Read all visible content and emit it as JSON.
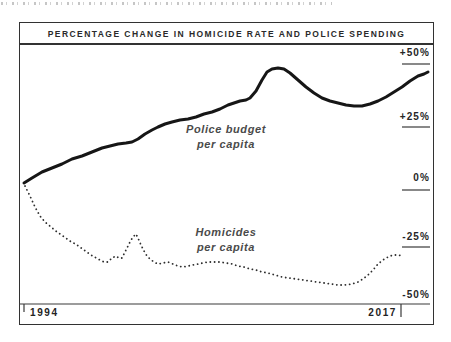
{
  "chart_data": {
    "type": "line",
    "title": "PERCENTAGE CHANGE IN HOMICIDE RATE AND POLICE SPENDING",
    "grid": false,
    "legend_position": "inline-annotations",
    "x_axis": {
      "range": [
        1994,
        2017
      ],
      "tick_labels": [
        "1994",
        "2017"
      ]
    },
    "y_axis": {
      "unit": "percent change",
      "range": [
        -55,
        55
      ],
      "tick_values": [
        50,
        25,
        0,
        -25,
        -50
      ],
      "tick_labels": [
        "+50%",
        "+25%",
        "0%",
        "-25%",
        "-50%"
      ]
    },
    "years": [
      1994,
      1995,
      1996,
      1997,
      1998,
      1999,
      2000,
      2001,
      2002,
      2003,
      2004,
      2005,
      2006,
      2007,
      2008,
      2009,
      2010,
      2011,
      2012,
      2013,
      2014,
      2015,
      2016,
      2017
    ],
    "series": [
      {
        "name": "Police budget per capita",
        "label_line1": "Police budget",
        "label_line2": "per capita",
        "line_style": "solid",
        "color": "#161616",
        "values_pct": [
          0,
          7,
          10,
          13,
          16,
          19,
          21,
          24,
          28,
          29,
          31,
          33,
          36,
          39,
          48,
          47,
          42,
          38,
          36,
          35,
          36,
          40,
          45,
          48
        ],
        "path_px": [
          [
            5,
            139
          ],
          [
            13,
            134
          ],
          [
            23,
            128
          ],
          [
            33,
            124
          ],
          [
            43,
            120
          ],
          [
            53,
            115
          ],
          [
            63,
            112
          ],
          [
            73,
            108
          ],
          [
            83,
            104
          ],
          [
            91,
            102
          ],
          [
            99,
            100
          ],
          [
            107,
            99
          ],
          [
            113,
            98
          ],
          [
            119,
            95
          ],
          [
            126,
            90
          ],
          [
            133,
            86
          ],
          [
            139,
            83
          ],
          [
            146,
            80
          ],
          [
            153,
            78
          ],
          [
            161,
            76
          ],
          [
            169,
            75
          ],
          [
            177,
            73
          ],
          [
            185,
            70
          ],
          [
            193,
            68
          ],
          [
            201,
            65
          ],
          [
            209,
            61
          ],
          [
            215,
            59
          ],
          [
            221,
            57
          ],
          [
            227,
            56
          ],
          [
            231,
            54
          ],
          [
            237,
            47
          ],
          [
            243,
            36
          ],
          [
            248,
            28
          ],
          [
            253,
            25
          ],
          [
            259,
            24
          ],
          [
            265,
            25
          ],
          [
            271,
            29
          ],
          [
            279,
            36
          ],
          [
            287,
            43
          ],
          [
            295,
            49
          ],
          [
            303,
            54
          ],
          [
            311,
            57
          ],
          [
            319,
            59
          ],
          [
            327,
            61
          ],
          [
            335,
            62
          ],
          [
            343,
            62
          ],
          [
            351,
            60
          ],
          [
            359,
            57
          ],
          [
            367,
            53
          ],
          [
            375,
            48
          ],
          [
            383,
            43
          ],
          [
            391,
            37
          ],
          [
            399,
            32
          ],
          [
            405,
            30
          ],
          [
            409,
            28
          ]
        ]
      },
      {
        "name": "Homicides per capita",
        "label_line1": "Homicides",
        "label_line2": "per capita",
        "line_style": "dotted",
        "color": "#2e2e2e",
        "values_pct": [
          0,
          -12,
          -18,
          -23,
          -28,
          -29,
          -18,
          -28,
          -30,
          -32,
          -31,
          -30,
          -31,
          -33,
          -35,
          -36,
          -37,
          -38,
          -40,
          -39,
          -34,
          -28,
          -28,
          -28
        ],
        "path_px": [
          [
            6,
            142
          ],
          [
            11,
            152
          ],
          [
            16,
            163
          ],
          [
            21,
            172
          ],
          [
            26,
            178
          ],
          [
            32,
            183
          ],
          [
            38,
            188
          ],
          [
            44,
            192
          ],
          [
            51,
            197
          ],
          [
            58,
            201
          ],
          [
            65,
            206
          ],
          [
            72,
            211
          ],
          [
            79,
            215
          ],
          [
            85,
            218
          ],
          [
            89,
            218
          ],
          [
            93,
            214
          ],
          [
            97,
            212
          ],
          [
            100,
            214
          ],
          [
            103,
            214
          ],
          [
            106,
            208
          ],
          [
            109,
            202
          ],
          [
            112,
            196
          ],
          [
            115,
            192
          ],
          [
            117,
            190
          ],
          [
            119,
            194
          ],
          [
            122,
            201
          ],
          [
            125,
            207
          ],
          [
            128,
            212
          ],
          [
            131,
            215
          ],
          [
            135,
            218
          ],
          [
            139,
            220
          ],
          [
            144,
            219
          ],
          [
            149,
            218
          ],
          [
            154,
            220
          ],
          [
            159,
            222
          ],
          [
            164,
            223
          ],
          [
            169,
            222
          ],
          [
            174,
            221
          ],
          [
            179,
            220
          ],
          [
            184,
            219
          ],
          [
            189,
            218
          ],
          [
            195,
            218
          ],
          [
            201,
            218
          ],
          [
            207,
            219
          ],
          [
            213,
            220
          ],
          [
            219,
            222
          ],
          [
            225,
            223
          ],
          [
            231,
            225
          ],
          [
            237,
            226
          ],
          [
            243,
            228
          ],
          [
            249,
            229
          ],
          [
            256,
            231
          ],
          [
            263,
            233
          ],
          [
            270,
            234
          ],
          [
            277,
            235
          ],
          [
            284,
            236
          ],
          [
            291,
            237
          ],
          [
            298,
            238
          ],
          [
            305,
            239
          ],
          [
            312,
            240
          ],
          [
            319,
            241
          ],
          [
            326,
            241
          ],
          [
            333,
            240
          ],
          [
            339,
            238
          ],
          [
            344,
            235
          ],
          [
            349,
            231
          ],
          [
            354,
            226
          ],
          [
            359,
            220
          ],
          [
            364,
            216
          ],
          [
            369,
            213
          ],
          [
            374,
            211
          ],
          [
            379,
            211
          ],
          [
            384,
            212
          ]
        ]
      }
    ]
  }
}
